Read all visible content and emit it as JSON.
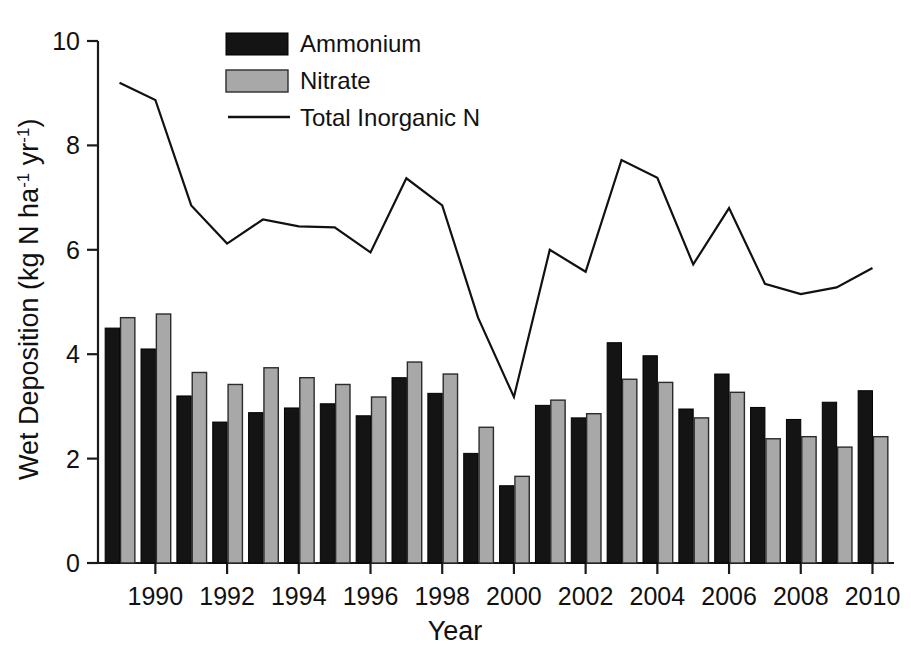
{
  "chart_data": {
    "type": "bar",
    "title": "",
    "xlabel": "Year",
    "ylabel": "Wet Deposition (kg N ha-1 yr-1)",
    "ylabel_parts": {
      "main": "Wet Deposition (kg N ha",
      "sup1": "-1",
      "mid": " yr",
      "sup2": "-1",
      "end": ")"
    },
    "categories": [
      1989,
      1990,
      1991,
      1992,
      1993,
      1994,
      1995,
      1996,
      1997,
      1998,
      1999,
      2000,
      2001,
      2002,
      2003,
      2004,
      2005,
      2006,
      2007,
      2008,
      2009,
      2010
    ],
    "x_tick_labels": [
      "1990",
      "1992",
      "1994",
      "1996",
      "1998",
      "2000",
      "2002",
      "2004",
      "2006",
      "2008",
      "2010"
    ],
    "x_tick_values": [
      1990,
      1992,
      1994,
      1996,
      1998,
      2000,
      2002,
      2004,
      2006,
      2008,
      2010
    ],
    "y_tick_labels": [
      "0",
      "2",
      "4",
      "6",
      "8",
      "10"
    ],
    "y_tick_values": [
      0,
      2,
      4,
      6,
      8,
      10
    ],
    "ylim": [
      0,
      10
    ],
    "xlim": [
      1988.4,
      2010.6
    ],
    "grid": false,
    "legend_position": "top-center",
    "series": [
      {
        "name": "Ammonium",
        "kind": "bar",
        "color": "#141414",
        "values": [
          4.5,
          4.1,
          3.2,
          2.7,
          2.88,
          2.97,
          3.05,
          2.82,
          3.55,
          3.25,
          2.1,
          1.48,
          3.02,
          2.78,
          4.22,
          3.97,
          2.95,
          3.62,
          2.98,
          2.75,
          3.08,
          3.3
        ]
      },
      {
        "name": "Nitrate",
        "kind": "bar",
        "color": "#a8a8a8",
        "values": [
          4.7,
          4.77,
          3.65,
          3.42,
          3.74,
          3.55,
          3.42,
          3.18,
          3.85,
          3.62,
          2.6,
          1.66,
          3.12,
          2.86,
          3.52,
          3.46,
          2.78,
          3.27,
          2.38,
          2.42,
          2.22,
          2.42
        ]
      },
      {
        "name": "Total Inorganic N",
        "kind": "line",
        "color": "#111111",
        "values": [
          9.2,
          8.87,
          6.85,
          6.12,
          6.58,
          6.45,
          6.43,
          5.95,
          7.37,
          6.85,
          4.7,
          3.18,
          6.0,
          5.58,
          7.72,
          7.38,
          5.72,
          6.8,
          5.35,
          5.15,
          5.28,
          5.65
        ]
      }
    ],
    "legend": [
      {
        "label": "Ammonium",
        "marker": "swatch-black"
      },
      {
        "label": "Nitrate",
        "marker": "swatch-gray"
      },
      {
        "label": "Total Inorganic N",
        "marker": "line-black"
      }
    ]
  }
}
